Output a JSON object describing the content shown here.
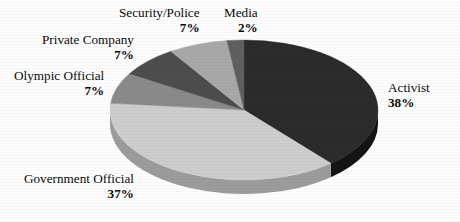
{
  "chart_data": {
    "type": "pie",
    "title": "",
    "subtitle": "",
    "xlabel": "",
    "ylabel": "",
    "legend_position": "none",
    "labels_position": "outside-with-leader-free",
    "grid": false,
    "start_angle_deg": 0,
    "direction": "clockwise",
    "categories": [
      "Activist",
      "Government Official",
      "Olympic Official",
      "Private Company",
      "Security/Police",
      "Media"
    ],
    "values": [
      38,
      37,
      7,
      7,
      7,
      2
    ],
    "value_suffix": "%",
    "colors": [
      "#2b2b2b",
      "#cdcdcd",
      "#8a8a8a",
      "#4d4d4d",
      "#a8a8a8",
      "#5f5f5f"
    ],
    "slices": [
      {
        "label": "Activist",
        "value": 38,
        "display_value": "38%",
        "color": "#2b2b2b",
        "side_color": "#141414"
      },
      {
        "label": "Government Official",
        "value": 37,
        "display_value": "37%",
        "color": "#cdcdcd",
        "side_color": "#9c9c9c"
      },
      {
        "label": "Olympic Official",
        "value": 7,
        "display_value": "7%",
        "color": "#8a8a8a",
        "side_color": "#6a6a6a"
      },
      {
        "label": "Private Company",
        "value": 7,
        "display_value": "7%",
        "color": "#4d4d4d",
        "side_color": "#3a3a3a"
      },
      {
        "label": "Security/Police",
        "value": 7,
        "display_value": "7%",
        "color": "#a8a8a8",
        "side_color": "#808080"
      },
      {
        "label": "Media",
        "value": 2,
        "display_value": "2%",
        "color": "#5f5f5f",
        "side_color": "#474747"
      }
    ]
  },
  "labels": {
    "activist": {
      "name": "Activist",
      "pct": "38%"
    },
    "government": {
      "name": "Government Official",
      "pct": "37%"
    },
    "olympic": {
      "name": "Olympic Official",
      "pct": "7%"
    },
    "private": {
      "name": "Private Company",
      "pct": "7%"
    },
    "security": {
      "name": "Security/Police",
      "pct": "7%"
    },
    "media": {
      "name": "Media",
      "pct": "2%"
    }
  },
  "style": {
    "background": "#fdfdfd",
    "text_color": "#0a0a0a"
  }
}
